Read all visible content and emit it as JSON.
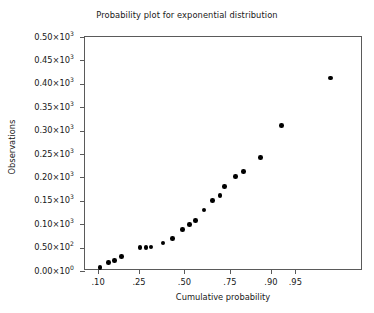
{
  "chart_data": {
    "type": "scatter",
    "title": "Probability plot for exponential distribution",
    "xlabel": "Cumulative probability",
    "ylabel": "Observations",
    "grid": false,
    "legend": null,
    "x_scale": "probability",
    "xlim": [
      0.07,
      1.0
    ],
    "ylim": [
      0,
      500
    ],
    "x_tick_labels": [
      ".10",
      ".25",
      ".50",
      ".75",
      ".90",
      ".95"
    ],
    "x_tick_values": [
      0.1,
      0.25,
      0.5,
      0.75,
      0.9,
      0.95
    ],
    "y_tick_labels": [
      "0.00×10",
      "0.50×10",
      "0.10×10",
      "0.15×10",
      "0.20×10",
      "0.25×10",
      "0.30×10",
      "0.35×10",
      "0.40×10",
      "0.45×10",
      "0.50×10"
    ],
    "y_tick_exponents": [
      "0",
      "2",
      "3",
      "3",
      "3",
      "3",
      "3",
      "3",
      "3",
      "3",
      "3"
    ],
    "y_tick_values": [
      0,
      50,
      100,
      150,
      200,
      250,
      300,
      350,
      400,
      450,
      500
    ],
    "points": [
      {
        "x": 0.105,
        "y": 8
      },
      {
        "x": 0.13,
        "y": 18
      },
      {
        "x": 0.15,
        "y": 22
      },
      {
        "x": 0.175,
        "y": 31
      },
      {
        "x": 0.255,
        "y": 50
      },
      {
        "x": 0.285,
        "y": 50
      },
      {
        "x": 0.31,
        "y": 51
      },
      {
        "x": 0.375,
        "y": 60
      },
      {
        "x": 0.43,
        "y": 70
      },
      {
        "x": 0.49,
        "y": 89
      },
      {
        "x": 0.53,
        "y": 99
      },
      {
        "x": 0.565,
        "y": 108
      },
      {
        "x": 0.615,
        "y": 130
      },
      {
        "x": 0.66,
        "y": 151
      },
      {
        "x": 0.7,
        "y": 161
      },
      {
        "x": 0.725,
        "y": 181
      },
      {
        "x": 0.775,
        "y": 202
      },
      {
        "x": 0.81,
        "y": 213
      },
      {
        "x": 0.87,
        "y": 242
      },
      {
        "x": 0.925,
        "y": 311
      },
      {
        "x": 0.985,
        "y": 412
      }
    ]
  }
}
